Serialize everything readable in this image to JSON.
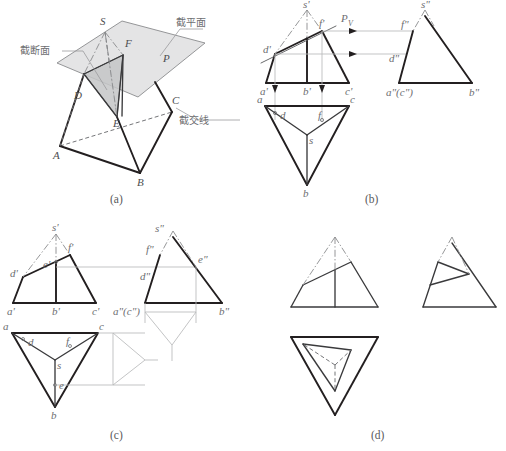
{
  "figure": {
    "title_visible": false,
    "panels": [
      {
        "id": "a",
        "caption": "(a)",
        "type": "pictorial-3d",
        "annotations": [
          {
            "name": "cut-section",
            "text": "截断面"
          },
          {
            "name": "cutting-plane",
            "text": "截平面"
          },
          {
            "name": "intersection-line",
            "text": "截交线"
          }
        ],
        "vertex_labels": [
          "S",
          "F",
          "P",
          "D",
          "C",
          "E",
          "A",
          "B"
        ]
      },
      {
        "id": "b",
        "caption": "(b)",
        "type": "orthographic-projection",
        "front_view_labels": [
          "s'",
          "f'",
          "d'",
          "a'",
          "b'",
          "c'"
        ],
        "plane_trace_label": "P",
        "plane_trace_subscript": "V",
        "side_view_labels": [
          "s\"",
          "f\"",
          "d\"",
          "a\"(c\")",
          "b\""
        ],
        "top_view_labels": [
          "a",
          "d",
          "f",
          "c",
          "s",
          "b"
        ]
      },
      {
        "id": "c",
        "caption": "(c)",
        "type": "orthographic-projection",
        "front_view_labels": [
          "s'",
          "f'",
          "e'",
          "d'",
          "a'",
          "b'",
          "c'"
        ],
        "side_view_labels": [
          "s\"",
          "f\"",
          "e\"",
          "d\"",
          "a\"(c\")",
          "b\""
        ],
        "top_view_labels": [
          "a",
          "d",
          "f",
          "c",
          "s",
          "e",
          "b"
        ]
      },
      {
        "id": "d",
        "caption": "(d)",
        "type": "orthographic-projection-final",
        "front_view_labels": [],
        "side_view_labels": [],
        "top_view_labels": []
      }
    ]
  },
  "panel_a": {
    "caption": "(a)",
    "label_cut_section": "截断面",
    "label_cutting_plane": "截平面",
    "label_intersection_line": "截交线",
    "v_S": "S",
    "v_F": "F",
    "v_P": "P",
    "v_D": "D",
    "v_C": "C",
    "v_E": "E",
    "v_A": "A",
    "v_B": "B"
  },
  "panel_b": {
    "caption": "(b)",
    "fv_s": "s'",
    "fv_f": "f'",
    "fv_d": "d'",
    "fv_a": "a'",
    "fv_b": "b'",
    "fv_c": "c'",
    "trace_P": "P",
    "trace_V": "V",
    "sv_s": "s\"",
    "sv_f": "f\"",
    "sv_d": "d\"",
    "sv_ac": "a\"(c\")",
    "sv_b": "b\"",
    "tv_a": "a",
    "tv_d": "d",
    "tv_f": "f",
    "tv_c": "c",
    "tv_s": "s",
    "tv_b": "b"
  },
  "panel_c": {
    "caption": "(c)",
    "fv_s": "s'",
    "fv_f": "f'",
    "fv_e": "e'",
    "fv_d": "d'",
    "fv_a": "a'",
    "fv_b": "b'",
    "fv_c": "c'",
    "sv_s": "s\"",
    "sv_f": "f\"",
    "sv_e": "e\"",
    "sv_d": "d\"",
    "sv_ac": "a\"(c\")",
    "sv_b": "b\"",
    "tv_a": "a",
    "tv_d": "d",
    "tv_f": "f",
    "tv_c": "c",
    "tv_s": "s",
    "tv_e": "e",
    "tv_b": "b"
  },
  "panel_d": {
    "caption": "(d)"
  }
}
